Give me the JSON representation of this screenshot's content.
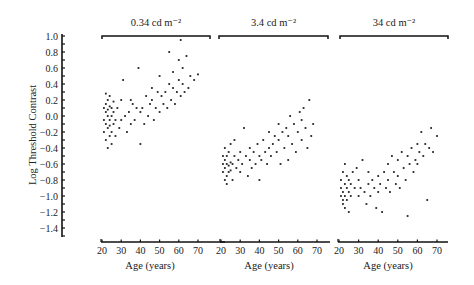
{
  "chart_data": {
    "type": "scatter",
    "ylabel": "Log Threshold Contrast",
    "ylim": [
      -1.5,
      1.0
    ],
    "yticks": [
      1.0,
      0.8,
      0.6,
      0.4,
      0.2,
      0.0,
      -0.2,
      -0.4,
      -0.6,
      -0.8,
      -1.0,
      -1.2,
      -1.4
    ],
    "ytick_labels": [
      "1.0",
      "0.8",
      "0.6",
      "0.4",
      "0.2",
      "0.0",
      "−0.2",
      "−0.4",
      "−0.6",
      "−0.8",
      "−1.0",
      "−1.2",
      "−1.4"
    ],
    "grid": false,
    "legend": null,
    "panels": [
      {
        "title": "0.34 cd m⁻²",
        "xlabel": "Age (years)",
        "xticks": [
          20,
          30,
          40,
          50,
          60,
          70
        ],
        "xlim": [
          20,
          75
        ],
        "points": [
          [
            21,
            -0.05
          ],
          [
            21,
            0.1
          ],
          [
            21,
            -0.2
          ],
          [
            22,
            0.28
          ],
          [
            22,
            0.05
          ],
          [
            22,
            -0.1
          ],
          [
            22,
            -0.3
          ],
          [
            22,
            0.15
          ],
          [
            23,
            0.0
          ],
          [
            23,
            -0.15
          ],
          [
            23,
            0.2
          ],
          [
            23,
            -0.4
          ],
          [
            23,
            0.08
          ],
          [
            24,
            -0.05
          ],
          [
            24,
            0.12
          ],
          [
            24,
            -0.25
          ],
          [
            24,
            0.25
          ],
          [
            24,
            -0.12
          ],
          [
            25,
            0.0
          ],
          [
            25,
            -0.2
          ],
          [
            25,
            0.1
          ],
          [
            25,
            -0.35
          ],
          [
            26,
            0.05
          ],
          [
            26,
            -0.1
          ],
          [
            26,
            0.18
          ],
          [
            27,
            -0.05
          ],
          [
            27,
            -0.25
          ],
          [
            28,
            0.1
          ],
          [
            29,
            -0.15
          ],
          [
            30,
            0.2
          ],
          [
            30,
            -0.05
          ],
          [
            31,
            0.45
          ],
          [
            32,
            0.0
          ],
          [
            33,
            -0.2
          ],
          [
            34,
            0.05
          ],
          [
            35,
            0.2
          ],
          [
            35,
            -0.1
          ],
          [
            36,
            0.15
          ],
          [
            37,
            -0.05
          ],
          [
            38,
            0.1
          ],
          [
            39,
            0.6
          ],
          [
            40,
            -0.35
          ],
          [
            40,
            0.05
          ],
          [
            41,
            0.1
          ],
          [
            42,
            -0.1
          ],
          [
            43,
            0.25
          ],
          [
            44,
            0.0
          ],
          [
            45,
            0.15
          ],
          [
            46,
            0.35
          ],
          [
            46,
            0.2
          ],
          [
            47,
            -0.05
          ],
          [
            48,
            0.1
          ],
          [
            49,
            0.3
          ],
          [
            50,
            0.5
          ],
          [
            50,
            0.05
          ],
          [
            51,
            0.25
          ],
          [
            52,
            0.15
          ],
          [
            53,
            0.3
          ],
          [
            54,
            0.1
          ],
          [
            55,
            0.8
          ],
          [
            55,
            0.4
          ],
          [
            56,
            0.2
          ],
          [
            57,
            0.55
          ],
          [
            57,
            0.35
          ],
          [
            58,
            0.15
          ],
          [
            59,
            0.3
          ],
          [
            60,
            0.45
          ],
          [
            60,
            0.7
          ],
          [
            61,
            0.25
          ],
          [
            61,
            0.95
          ],
          [
            62,
            0.4
          ],
          [
            62,
            0.6
          ],
          [
            63,
            0.3
          ],
          [
            64,
            0.75
          ],
          [
            65,
            0.35
          ],
          [
            66,
            0.5
          ],
          [
            68,
            0.45
          ],
          [
            70,
            0.52
          ]
        ]
      },
      {
        "title": "3.4 cd m⁻²",
        "xlabel": "Age (years)",
        "xticks": [
          20,
          30,
          40,
          50,
          60,
          70
        ],
        "xlim": [
          20,
          75
        ],
        "points": [
          [
            21,
            -0.6
          ],
          [
            21,
            -0.7
          ],
          [
            21,
            -0.5
          ],
          [
            22,
            -0.65
          ],
          [
            22,
            -0.55
          ],
          [
            22,
            -0.8
          ],
          [
            22,
            -0.4
          ],
          [
            23,
            -0.6
          ],
          [
            23,
            -0.75
          ],
          [
            23,
            -0.5
          ],
          [
            23,
            -0.85
          ],
          [
            24,
            -0.62
          ],
          [
            24,
            -0.45
          ],
          [
            24,
            -0.7
          ],
          [
            25,
            -0.58
          ],
          [
            25,
            -0.68
          ],
          [
            25,
            -0.35
          ],
          [
            26,
            -0.6
          ],
          [
            26,
            -0.8
          ],
          [
            27,
            -0.5
          ],
          [
            27,
            -0.3
          ],
          [
            28,
            -0.65
          ],
          [
            29,
            -0.55
          ],
          [
            30,
            -0.45
          ],
          [
            30,
            -0.7
          ],
          [
            31,
            -0.6
          ],
          [
            32,
            -0.15
          ],
          [
            33,
            -0.5
          ],
          [
            34,
            -0.75
          ],
          [
            35,
            -0.4
          ],
          [
            35,
            -0.55
          ],
          [
            36,
            -0.65
          ],
          [
            37,
            -0.45
          ],
          [
            38,
            -0.6
          ],
          [
            39,
            -0.35
          ],
          [
            40,
            -0.5
          ],
          [
            40,
            -0.8
          ],
          [
            41,
            -0.55
          ],
          [
            42,
            -0.3
          ],
          [
            43,
            -0.45
          ],
          [
            44,
            -0.6
          ],
          [
            45,
            -0.2
          ],
          [
            45,
            -0.4
          ],
          [
            46,
            -0.5
          ],
          [
            47,
            -0.35
          ],
          [
            48,
            -0.25
          ],
          [
            49,
            -0.45
          ],
          [
            50,
            -0.1
          ],
          [
            50,
            -0.3
          ],
          [
            51,
            -0.6
          ],
          [
            52,
            -0.2
          ],
          [
            53,
            -0.4
          ],
          [
            54,
            -0.15
          ],
          [
            55,
            -0.25
          ],
          [
            55,
            -0.55
          ],
          [
            56,
            0.0
          ],
          [
            57,
            -0.35
          ],
          [
            58,
            -0.1
          ],
          [
            59,
            -0.45
          ],
          [
            60,
            -0.2
          ],
          [
            61,
            0.05
          ],
          [
            62,
            -0.05
          ],
          [
            62,
            -0.3
          ],
          [
            63,
            0.1
          ],
          [
            64,
            -0.15
          ],
          [
            65,
            -0.4
          ],
          [
            66,
            0.2
          ],
          [
            67,
            -0.25
          ],
          [
            68,
            -0.1
          ]
        ]
      },
      {
        "title": "34 cd m⁻²",
        "xlabel": "Age (years)",
        "xticks": [
          20,
          30,
          40,
          50,
          60,
          70
        ],
        "xlim": [
          20,
          75
        ],
        "points": [
          [
            21,
            -0.9
          ],
          [
            21,
            -1.0
          ],
          [
            21,
            -0.8
          ],
          [
            22,
            -0.95
          ],
          [
            22,
            -1.1
          ],
          [
            22,
            -0.7
          ],
          [
            22,
            -1.05
          ],
          [
            23,
            -0.85
          ],
          [
            23,
            -1.0
          ],
          [
            23,
            -0.6
          ],
          [
            23,
            -1.15
          ],
          [
            24,
            -0.9
          ],
          [
            24,
            -0.75
          ],
          [
            24,
            -1.05
          ],
          [
            25,
            -0.95
          ],
          [
            25,
            -0.8
          ],
          [
            25,
            -1.2
          ],
          [
            26,
            -0.85
          ],
          [
            26,
            -1.0
          ],
          [
            27,
            -0.7
          ],
          [
            28,
            -0.9
          ],
          [
            29,
            -0.65
          ],
          [
            30,
            -1.0
          ],
          [
            30,
            -0.8
          ],
          [
            31,
            -0.9
          ],
          [
            32,
            -0.55
          ],
          [
            33,
            -0.95
          ],
          [
            34,
            -1.1
          ],
          [
            35,
            -0.85
          ],
          [
            35,
            -0.7
          ],
          [
            36,
            -1.0
          ],
          [
            37,
            -0.8
          ],
          [
            38,
            -0.9
          ],
          [
            39,
            -1.15
          ],
          [
            40,
            -0.75
          ],
          [
            40,
            -0.95
          ],
          [
            41,
            -0.85
          ],
          [
            42,
            -1.2
          ],
          [
            43,
            -0.7
          ],
          [
            44,
            -0.9
          ],
          [
            45,
            -0.6
          ],
          [
            45,
            -0.8
          ],
          [
            46,
            -0.95
          ],
          [
            47,
            -0.5
          ],
          [
            48,
            -0.7
          ],
          [
            49,
            -0.85
          ],
          [
            50,
            -0.55
          ],
          [
            50,
            -0.75
          ],
          [
            51,
            -0.9
          ],
          [
            52,
            -0.45
          ],
          [
            53,
            -0.65
          ],
          [
            54,
            -0.8
          ],
          [
            55,
            -0.5
          ],
          [
            55,
            -1.25
          ],
          [
            56,
            -0.6
          ],
          [
            57,
            -0.4
          ],
          [
            58,
            -0.7
          ],
          [
            59,
            -0.55
          ],
          [
            60,
            -0.35
          ],
          [
            60,
            -0.6
          ],
          [
            61,
            -0.45
          ],
          [
            62,
            -0.2
          ],
          [
            63,
            -0.5
          ],
          [
            64,
            -0.35
          ],
          [
            65,
            -1.05
          ],
          [
            66,
            -0.4
          ],
          [
            67,
            -0.15
          ],
          [
            68,
            -0.45
          ],
          [
            70,
            -0.25
          ]
        ]
      }
    ]
  }
}
